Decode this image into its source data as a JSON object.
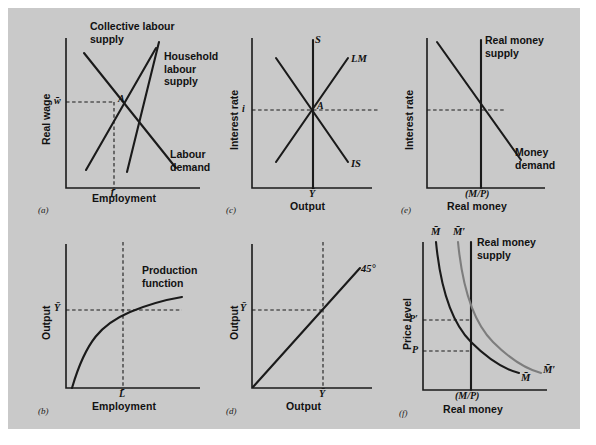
{
  "figure": {
    "background_color": "#c9c9c9",
    "line_color": "#1a1a1a",
    "secondary_line_color": "#7d7d7d",
    "panels": [
      {
        "key": "a",
        "letter": "(a)",
        "xlabel": "Employment",
        "ylabel": "Real wage",
        "xtick": "L̄",
        "ytick": "w̄",
        "point": "A",
        "curves": [
          {
            "name": "collective-labour-supply",
            "label": "Collective labour\nsupply",
            "label_line1": "Collective labour",
            "label_line2": "supply"
          },
          {
            "name": "household-labour-supply",
            "label_line1": "Household",
            "label_line2": "labour supply"
          },
          {
            "name": "labour-demand",
            "label_line1": "Labour",
            "label_line2": "demand"
          }
        ]
      },
      {
        "key": "b",
        "letter": "(b)",
        "xlabel": "Employment",
        "ylabel": "Output",
        "xtick": "L̄",
        "ytick": "Ȳ",
        "curves": [
          {
            "name": "production-function",
            "label_line1": "Production",
            "label_line2": "function"
          }
        ]
      },
      {
        "key": "c",
        "letter": "(c)",
        "xlabel": "Output",
        "ylabel": "Interest rate",
        "xtick": "Ȳ",
        "ytick": "i",
        "point": "A",
        "curves": [
          {
            "name": "supply-line",
            "label": "S"
          },
          {
            "name": "lm-curve",
            "label": "LM"
          },
          {
            "name": "is-curve",
            "label": "IS"
          }
        ]
      },
      {
        "key": "d",
        "letter": "(d)",
        "xlabel": "Output",
        "ylabel": "Output",
        "xtick": "Ȳ",
        "ytick": "Ȳ",
        "curves": [
          {
            "name": "forty-five-degree-line",
            "label": "45°"
          }
        ]
      },
      {
        "key": "e",
        "letter": "(e)",
        "xlabel": "Real money",
        "ylabel": "Interest rate",
        "xtick": "(M/P)",
        "curves": [
          {
            "name": "real-money-supply",
            "label_line1": "Real money",
            "label_line2": "supply"
          },
          {
            "name": "money-demand",
            "label_line1": "Money",
            "label_line2": "demand"
          }
        ]
      },
      {
        "key": "f",
        "letter": "(f)",
        "xlabel": "Real money",
        "ylabel": "Price level",
        "xtick": "(M/P)",
        "yticks": [
          "P′",
          "P"
        ],
        "curves": [
          {
            "name": "real-money-supply",
            "label_line1": "Real money",
            "label_line2": "supply"
          },
          {
            "name": "money-stock-m-top",
            "label": "M̄"
          },
          {
            "name": "money-stock-m-prime-top",
            "label": "M̄′"
          },
          {
            "name": "money-stock-m-prime-right",
            "label": "M̄′"
          },
          {
            "name": "money-stock-m-right",
            "label": "M̄"
          }
        ]
      }
    ]
  }
}
